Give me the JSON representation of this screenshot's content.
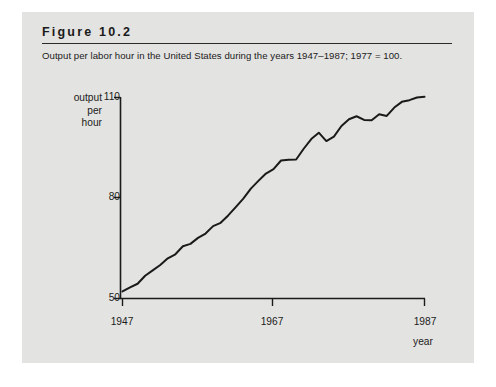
{
  "figure": {
    "label": "Figure 10.2",
    "caption": "Output per labor hour in the United States during the years 1947–1987; 1977 = 100."
  },
  "chart_data": {
    "type": "line",
    "title": "Output per labor hour in the United States during the years 1947–1987; 1977 = 100.",
    "xlabel": "year",
    "ylabel": "output per hour",
    "ylabel_lines": [
      "output",
      "per",
      "hour"
    ],
    "xlim": [
      1947,
      1987
    ],
    "ylim": [
      50,
      110
    ],
    "grid": false,
    "legend": null,
    "x_ticks": [
      1947,
      1967,
      1987
    ],
    "x_tick_labels": [
      "1947",
      "1967",
      "1987"
    ],
    "y_ticks": [
      50,
      80,
      110
    ],
    "y_tick_labels": [
      "50",
      "80",
      "110"
    ],
    "series": [
      {
        "name": "output per hour",
        "color": "#1a1a1a",
        "x": [
          1947,
          1948,
          1949,
          1950,
          1951,
          1952,
          1953,
          1954,
          1955,
          1956,
          1957,
          1958,
          1959,
          1960,
          1961,
          1962,
          1963,
          1964,
          1965,
          1966,
          1967,
          1968,
          1969,
          1970,
          1971,
          1972,
          1973,
          1974,
          1975,
          1976,
          1977,
          1978,
          1979,
          1980,
          1981,
          1982,
          1983,
          1984,
          1985,
          1986,
          1987
        ],
        "y": [
          52.1,
          53.3,
          54.4,
          56.8,
          58.4,
          60.0,
          62.0,
          63.2,
          65.6,
          66.3,
          68.1,
          69.4,
          71.6,
          72.6,
          74.8,
          77.3,
          79.8,
          82.8,
          85.1,
          87.3,
          88.6,
          91.2,
          91.4,
          91.5,
          94.7,
          97.6,
          99.5,
          97.0,
          98.3,
          101.5,
          103.5,
          104.4,
          103.3,
          103.2,
          105.0,
          104.5,
          107.0,
          108.7,
          109.2,
          110.0,
          110.2
        ]
      }
    ]
  }
}
